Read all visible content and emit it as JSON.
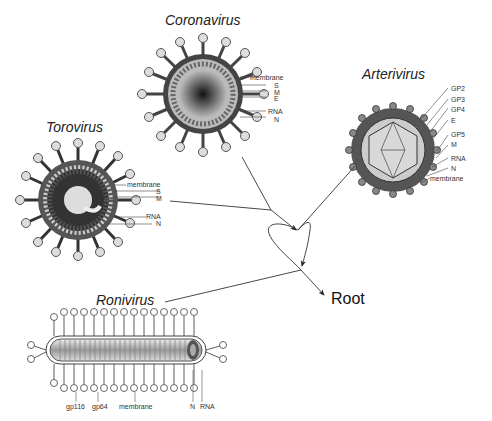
{
  "diagram": {
    "root_label": "Root",
    "viruses": [
      {
        "name": "Coronavirus",
        "labels": [
          "membrane",
          "S",
          "M",
          "E",
          "RNA",
          "N"
        ]
      },
      {
        "name": "Arterivirus",
        "labels": [
          "GP2",
          "GP3",
          "GP4",
          "E",
          "GP5",
          "M",
          "RNA",
          "N",
          "membrane"
        ]
      },
      {
        "name": "Torovirus",
        "labels": [
          "membrane",
          "S",
          "M",
          "RNA",
          "N"
        ]
      },
      {
        "name": "Ronivirus",
        "labels": [
          "gp116",
          "gp64",
          "membrane",
          "N",
          "RNA"
        ]
      }
    ],
    "colors": {
      "line": "#333333",
      "virion_dark": "#3a3a3a",
      "virion_light": "#bdbdbd",
      "text": "#222222"
    }
  }
}
